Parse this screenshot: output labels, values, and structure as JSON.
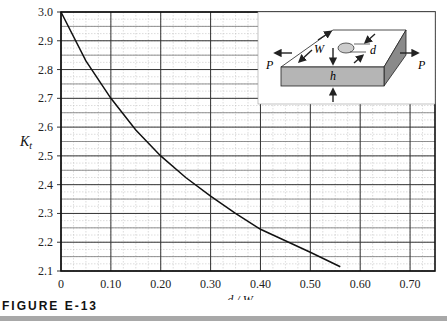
{
  "figure": {
    "caption": "FIGURE E-13"
  },
  "chart_data": {
    "type": "line",
    "title": "",
    "xlabel": "d / W",
    "ylabel": "K_t",
    "xlim": [
      0,
      0.75
    ],
    "ylim": [
      2.1,
      3.0
    ],
    "x_ticks": [
      "0",
      "0.10",
      "0.20",
      "0.30",
      "0.40",
      "0.50",
      "0.60",
      "0.70"
    ],
    "y_ticks": [
      "3.0",
      "2.9",
      "2.8",
      "2.7",
      "2.6",
      "2.5",
      "2.4",
      "2.3",
      "2.2",
      "2.1"
    ],
    "grid": true,
    "series": [
      {
        "name": "K_t",
        "x": [
          0,
          0.05,
          0.1,
          0.15,
          0.2,
          0.25,
          0.3,
          0.35,
          0.4,
          0.45,
          0.5,
          0.56
        ],
        "y": [
          3.0,
          2.83,
          2.7,
          2.59,
          2.5,
          2.425,
          2.36,
          2.3,
          2.245,
          2.205,
          2.165,
          2.115
        ]
      }
    ],
    "inset": {
      "description": "Plate of width W and thickness h with a central hole of diameter d, loaded in tension by P",
      "labels": [
        "W",
        "d",
        "h",
        "P",
        "P"
      ]
    }
  }
}
